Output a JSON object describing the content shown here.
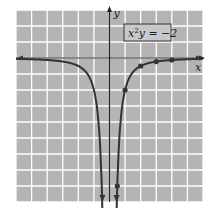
{
  "chart_data": {
    "type": "line",
    "title": "",
    "equation_label": "x²y = −2",
    "equation_parts": {
      "x": "x",
      "exp": "2",
      "rest": "y = −2"
    },
    "xlabel": "x",
    "ylabel": "y",
    "xlim": [
      -6,
      6
    ],
    "ylim": [
      -9,
      3
    ],
    "grid": true,
    "grid_step": 1,
    "legend_position": "none",
    "series": [
      {
        "name": "y = -2/x^2",
        "points": [
          [
            1,
            -2
          ],
          [
            2,
            -0.5
          ],
          [
            3,
            -0.222
          ],
          [
            4,
            -0.125
          ],
          [
            0.5,
            -8
          ]
        ],
        "symmetric_branch": "negative x (mirror)"
      }
    ],
    "colors": {
      "background": "#b4b4b4",
      "grid": "#ffffff",
      "curve": "#333333",
      "axis": "#222222",
      "label_box_fill": "#c8c8c8"
    }
  }
}
